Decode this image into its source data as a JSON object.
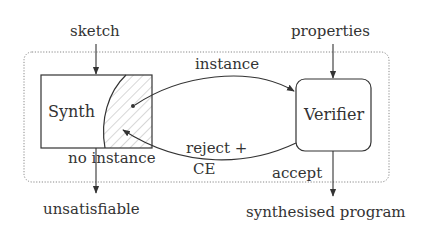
{
  "diagram": {
    "inputs": {
      "sketch": "sketch",
      "properties": "properties"
    },
    "nodes": {
      "synth": "Synth",
      "verifier": "Verifier"
    },
    "edges": {
      "instance": "instance",
      "reject_line1": "reject +",
      "reject_line2": "CE",
      "no_instance": "no instance",
      "accept": "accept"
    },
    "outputs": {
      "unsatisfiable": "unsatisfiable",
      "synthesised_program": "synthesised program"
    },
    "colors": {
      "stroke": "#333333",
      "hatch": "#b0b0b0",
      "container_border": "#888888"
    }
  }
}
